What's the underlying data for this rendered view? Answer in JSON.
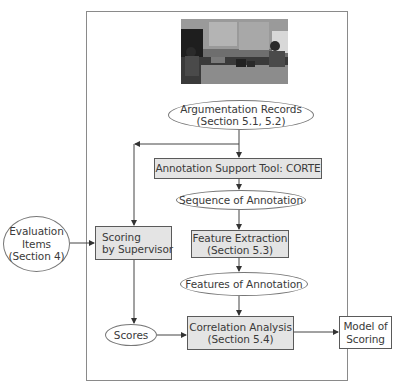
{
  "diagram": {
    "photo": {
      "description": "photograph of argumentation session in classroom"
    },
    "nodes": {
      "argumentation_records": {
        "line1": "Argumentation Records",
        "line2": "(Section 5.1, 5.2)",
        "shape": "ellipse"
      },
      "corte": {
        "line1": "Annotation Support Tool: CORTE",
        "shape": "box"
      },
      "sequence_of_annotation": {
        "line1": "Sequence of Annotation",
        "shape": "ellipse"
      },
      "feature_extraction": {
        "line1": "Feature Extraction",
        "line2": "(Section 5.3)",
        "shape": "box"
      },
      "features_of_annotation": {
        "line1": "Features of Annotation",
        "shape": "ellipse"
      },
      "correlation_analysis": {
        "line1": "Correlation Analysis",
        "line2": "(Section 5.4)",
        "shape": "box"
      },
      "evaluation_items": {
        "line1": "Evaluation",
        "line2": "Items",
        "line3": "(Section 4)",
        "shape": "circle"
      },
      "scoring_by_supervisor": {
        "line1": "Scoring",
        "line2": "by Supervisor",
        "shape": "box"
      },
      "scores": {
        "line1": "Scores",
        "shape": "ellipse"
      },
      "model_of_scoring": {
        "line1": "Model of",
        "line2": "Scoring",
        "shape": "box"
      }
    },
    "edges": [
      {
        "from": "photo",
        "to": "argumentation_records"
      },
      {
        "from": "argumentation_records",
        "to": "corte"
      },
      {
        "from": "argumentation_records",
        "to": "scoring_by_supervisor"
      },
      {
        "from": "corte",
        "to": "sequence_of_annotation"
      },
      {
        "from": "sequence_of_annotation",
        "to": "feature_extraction"
      },
      {
        "from": "feature_extraction",
        "to": "features_of_annotation"
      },
      {
        "from": "features_of_annotation",
        "to": "correlation_analysis"
      },
      {
        "from": "evaluation_items",
        "to": "scoring_by_supervisor"
      },
      {
        "from": "scoring_by_supervisor",
        "to": "scores"
      },
      {
        "from": "scores",
        "to": "correlation_analysis"
      },
      {
        "from": "correlation_analysis",
        "to": "model_of_scoring"
      }
    ],
    "colors": {
      "box_fill": "#e4e4e4",
      "stroke": "#5a5a5a",
      "text": "#3a3a3a"
    }
  }
}
